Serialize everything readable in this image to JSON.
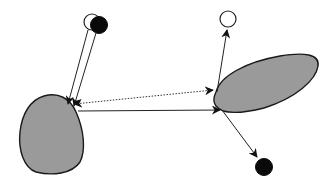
{
  "diagram": {
    "title": "",
    "nodes": [
      {
        "id": "open-node-top-left",
        "kind": "open-circle",
        "cx": 92,
        "cy": 22,
        "r": 8
      },
      {
        "id": "filled-node-top-left",
        "kind": "filled-circle",
        "cx": 98,
        "cy": 25,
        "r": 8.5
      },
      {
        "id": "open-node-top-right",
        "kind": "open-circle",
        "cx": 228,
        "cy": 20,
        "r": 8
      },
      {
        "id": "filled-node-bottom-right",
        "kind": "filled-circle",
        "cx": 264,
        "cy": 167,
        "r": 8.5
      },
      {
        "id": "blob-left",
        "kind": "gray-region"
      },
      {
        "id": "blob-right",
        "kind": "gray-region"
      }
    ],
    "edges": [
      {
        "from": "open-node-top-left",
        "to": "blob-left",
        "style": "solid"
      },
      {
        "from": "filled-node-top-left",
        "to": "blob-left",
        "style": "solid"
      },
      {
        "from": "blob-left",
        "to": "blob-right",
        "style": "dotted",
        "arrows": "both"
      },
      {
        "from": "blob-left",
        "to": "blob-right",
        "style": "solid",
        "arrows": "end"
      },
      {
        "from": "blob-right",
        "to": "open-node-top-right",
        "style": "solid"
      },
      {
        "from": "blob-right",
        "to": "filled-node-bottom-right",
        "style": "solid"
      }
    ],
    "colors": {
      "region_fill": "#9a9a9a",
      "stroke": "#222222",
      "background": "#ffffff"
    }
  }
}
